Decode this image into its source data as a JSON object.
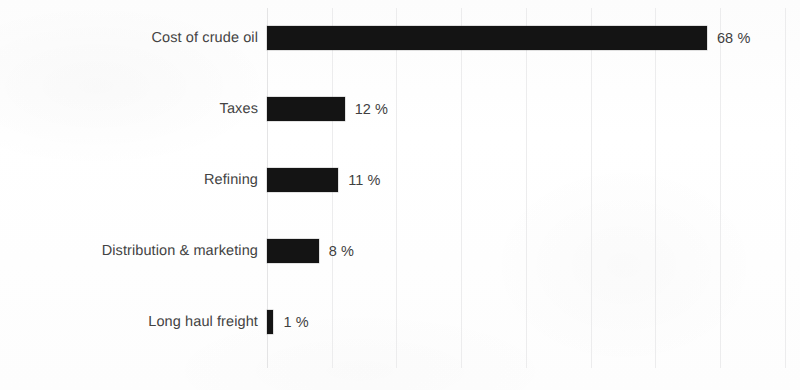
{
  "chart_data": {
    "type": "bar",
    "orientation": "horizontal",
    "title": "",
    "subtitle": "",
    "xlabel": "",
    "ylabel": "",
    "categories": [
      "Cost of crude oil",
      "Taxes",
      "Refining",
      "Distribution & marketing",
      "Long haul freight"
    ],
    "values": [
      68,
      12,
      11,
      8,
      1
    ],
    "value_labels": [
      "68 %",
      "12 %",
      "11 %",
      "8 %",
      "1 %"
    ],
    "unit": "%",
    "xlim": [
      0,
      80
    ],
    "ylim": null,
    "x_tick_labels": [],
    "gridlines": {
      "vertical": true,
      "horizontal": false,
      "values": [
        0,
        10,
        20,
        30,
        40,
        50,
        60,
        70,
        80
      ],
      "color": "#ececed"
    },
    "legend": null,
    "legend_position": "none",
    "annotations": [],
    "series": [
      {
        "name": "",
        "color": "#141414",
        "values": [
          68,
          12,
          11,
          8,
          1
        ]
      }
    ]
  },
  "style": {
    "bar_color": "#141414",
    "label_color": "#434343",
    "value_color": "#3f3f3f",
    "grid_color": "#ececed",
    "background": "#fdfdfd"
  }
}
